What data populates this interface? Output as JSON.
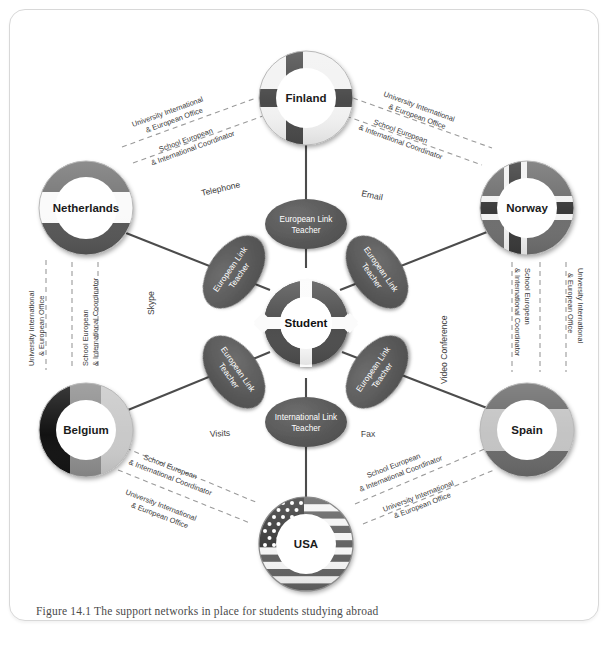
{
  "figure": {
    "caption": "Figure 14.1  The support networks in place for students studying abroad",
    "center_label": "Student"
  },
  "colors": {
    "ellipse_fill": "#5a5a5a",
    "ellipse_text": "#ffffff",
    "line": "#4c4c4c",
    "dashed_line": "#8c8c8c",
    "frame_border": "#d8d8d8",
    "caption_text": "#4a4a4a"
  },
  "link_teachers": [
    {
      "id": "lt-top",
      "label_line1": "European Link",
      "label_line2": "Teacher"
    },
    {
      "id": "lt-upper-right",
      "label_line1": "European Link",
      "label_line2": "Teacher"
    },
    {
      "id": "lt-lower-right",
      "label_line1": "European Link",
      "label_line2": "Teacher"
    },
    {
      "id": "lt-bottom",
      "label_line1": "International Link",
      "label_line2": "Teacher"
    },
    {
      "id": "lt-lower-left",
      "label_line1": "European Link",
      "label_line2": "Teacher"
    },
    {
      "id": "lt-upper-left",
      "label_line1": "European Link",
      "label_line2": "Teacher"
    }
  ],
  "countries": [
    {
      "id": "finland",
      "name": "Finland"
    },
    {
      "id": "norway",
      "name": "Norway"
    },
    {
      "id": "spain",
      "name": "Spain"
    },
    {
      "id": "usa",
      "name": "USA"
    },
    {
      "id": "belgium",
      "name": "Belgium"
    },
    {
      "id": "netherlands",
      "name": "Netherlands"
    }
  ],
  "channels": [
    {
      "id": "telephone",
      "label": "Telephone"
    },
    {
      "id": "email",
      "label": "Email"
    },
    {
      "id": "video-conference",
      "label": "Video Conference"
    },
    {
      "id": "fax",
      "label": "Fax"
    },
    {
      "id": "visits",
      "label": "Visits"
    },
    {
      "id": "skype",
      "label": "Skype"
    }
  ],
  "support_labels": {
    "university_line1": "University International",
    "university_line2": "& European Office",
    "school_line1": "School European",
    "school_line2": "& International Coordinator"
  },
  "support_groups": [
    {
      "id": "finland-left",
      "country": "Finland",
      "university_first": true
    },
    {
      "id": "finland-right",
      "country": "Finland",
      "university_first": true
    },
    {
      "id": "netherlands",
      "country": "Netherlands",
      "university_first": false
    },
    {
      "id": "norway",
      "country": "Norway",
      "university_first": false
    },
    {
      "id": "belgium",
      "country": "Belgium",
      "university_first": false
    },
    {
      "id": "spain",
      "country": "Spain",
      "university_first": false
    },
    {
      "id": "usa-left",
      "country": "USA",
      "university_first": false
    },
    {
      "id": "usa-right",
      "country": "USA",
      "university_first": false
    }
  ]
}
